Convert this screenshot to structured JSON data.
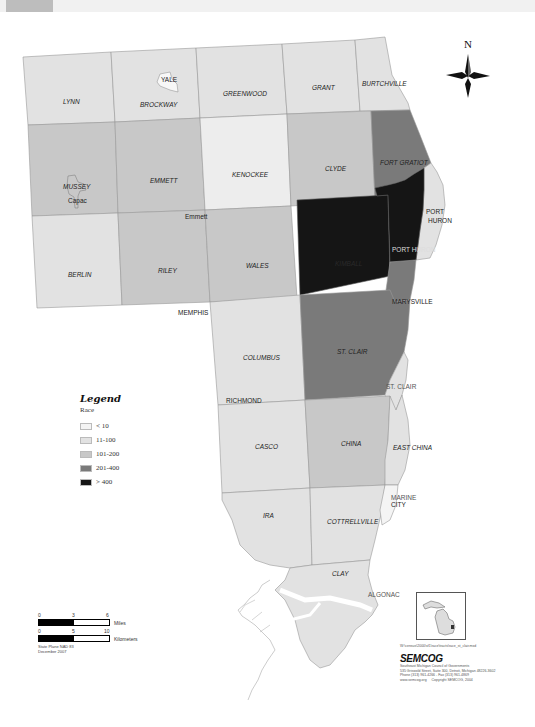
{
  "header": {
    "tab_label": "",
    "bar_text": ""
  },
  "map": {
    "north_label": "N",
    "townships": [
      {
        "name": "LYNN",
        "class": "11-100",
        "color": "#e2e2e2"
      },
      {
        "name": "BROCKWAY",
        "class": "11-100",
        "color": "#e2e2e2"
      },
      {
        "name": "GREENWOOD",
        "class": "11-100",
        "color": "#e2e2e2"
      },
      {
        "name": "GRANT",
        "class": "11-100",
        "color": "#e2e2e2"
      },
      {
        "name": "BURTCHVILLE",
        "class": "11-100",
        "color": "#e2e2e2"
      },
      {
        "name": "MUSSEY",
        "class": "101-200",
        "color": "#c8c8c8"
      },
      {
        "name": "EMMETT",
        "class": "101-200",
        "color": "#c8c8c8"
      },
      {
        "name": "KENOCKEE",
        "class": "< 10",
        "color": "#ededed"
      },
      {
        "name": "CLYDE",
        "class": "101-200",
        "color": "#c8c8c8"
      },
      {
        "name": "FORT GRATIOT",
        "class": "201-400",
        "color": "#7a7a7a"
      },
      {
        "name": "BERLIN",
        "class": "11-100",
        "color": "#e2e2e2"
      },
      {
        "name": "RILEY",
        "class": "101-200",
        "color": "#c8c8c8"
      },
      {
        "name": "WALES",
        "class": "101-200",
        "color": "#c8c8c8"
      },
      {
        "name": "KIMBALL",
        "class": "> 400",
        "color": "#151515"
      },
      {
        "name": "PORT HURON",
        "class": "> 400",
        "color": "#151515"
      },
      {
        "name": "COLUMBUS",
        "class": "11-100",
        "color": "#e2e2e2"
      },
      {
        "name": "ST. CLAIR",
        "class": "201-400",
        "color": "#7a7a7a"
      },
      {
        "name": "CASCO",
        "class": "11-100",
        "color": "#e2e2e2"
      },
      {
        "name": "CHINA",
        "class": "101-200",
        "color": "#c8c8c8"
      },
      {
        "name": "EAST CHINA",
        "class": "11-100",
        "color": "#e2e2e2"
      },
      {
        "name": "IRA",
        "class": "11-100",
        "color": "#e2e2e2"
      },
      {
        "name": "COTTRELLVILLE",
        "class": "11-100",
        "color": "#e2e2e2"
      },
      {
        "name": "CLAY",
        "class": "11-100",
        "color": "#e2e2e2"
      }
    ],
    "cities": [
      {
        "name": "YALE"
      },
      {
        "name": "Capac"
      },
      {
        "name": "Emmett"
      },
      {
        "name": "MEMPHIS"
      },
      {
        "name": "PORT HURON"
      },
      {
        "name": "MARYSVILLE"
      },
      {
        "name": "RICHMOND"
      },
      {
        "name": "ST. CLAIR"
      },
      {
        "name": "MARINE CITY"
      },
      {
        "name": "ALGONAC"
      }
    ]
  },
  "legend": {
    "title": "Legend",
    "subtitle": "Race",
    "items": [
      {
        "label": "< 10",
        "color": "#f4f4f4"
      },
      {
        "label": "11-100",
        "color": "#e2e2e2"
      },
      {
        "label": "101-200",
        "color": "#c8c8c8"
      },
      {
        "label": "201-400",
        "color": "#7a7a7a"
      },
      {
        "label": "> 400",
        "color": "#151515"
      }
    ]
  },
  "scalebar": {
    "miles_ticks": [
      "0",
      "3",
      "6"
    ],
    "miles_label": "Miles",
    "km_ticks": [
      "0",
      "5",
      "10"
    ],
    "km_label": "Kilometers",
    "note1": "State Plane NAD 83",
    "note2": "December 2007"
  },
  "credit": {
    "path": "W:\\census\\2000\\sf1\\race\\tracts\\race_st_clair.mxd",
    "logo": "SEMCOG",
    "org": "Southeast Michigan Council of Governments",
    "address": "535 Griswold Street, Suite 300, Detroit, Michigan 48226-3602",
    "phone": "Phone (313) 961-4266 - Fax (313) 961-4869",
    "web": "www.semcog.org",
    "copyright": "Copyright SEMCOG, 2004"
  }
}
